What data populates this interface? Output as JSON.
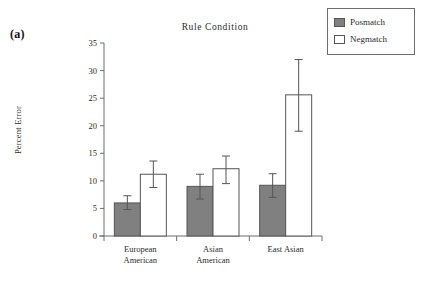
{
  "panel": {
    "label": "(a)"
  },
  "legend": {
    "entries": [
      {
        "name": "posmatch",
        "label": "Posmatch",
        "swatch": "filled",
        "color": "#808080"
      },
      {
        "name": "negmatch",
        "label": "Negmatch",
        "swatch": "open",
        "color": "#ffffff"
      }
    ]
  },
  "chart_data": {
    "type": "bar",
    "title": "Rule  Condition",
    "xlabel": "",
    "ylabel": "Percent Error",
    "categories": [
      "European\nAmerican",
      "Asian\nAmerican",
      "East Asian"
    ],
    "category_lines": [
      [
        "European",
        "American"
      ],
      [
        "Asian",
        "American"
      ],
      [
        "East Asian",
        ""
      ]
    ],
    "ylim": [
      0,
      35
    ],
    "yticks": [
      0,
      5,
      10,
      15,
      20,
      25,
      30,
      35
    ],
    "ytick_labels": [
      "0",
      "5",
      "10",
      "15",
      "20",
      "25",
      "30",
      "35"
    ],
    "grid": false,
    "legend_position": "top-right-outside",
    "error_bars": "symmetric",
    "series": [
      {
        "name": "Posmatch",
        "color": "#808080",
        "values": [
          6.0,
          9.0,
          9.2
        ],
        "err_low": [
          4.8,
          6.7,
          7.0
        ],
        "err_high": [
          7.3,
          11.2,
          11.3
        ]
      },
      {
        "name": "Negmatch",
        "color": "#ffffff",
        "values": [
          11.2,
          12.2,
          25.6
        ],
        "err_low": [
          8.8,
          9.5,
          19.0
        ],
        "err_high": [
          13.6,
          14.5,
          32.0
        ]
      }
    ]
  }
}
